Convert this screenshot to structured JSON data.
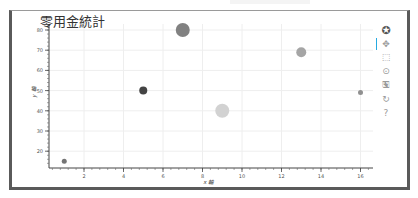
{
  "chart_data": {
    "type": "scatter",
    "title": "零用金統計",
    "xlabel": "x 軸",
    "ylabel": "y 軸",
    "xlim": [
      0.2,
      16.7
    ],
    "ylim": [
      12,
      83
    ],
    "x_ticks": [
      2,
      4,
      6,
      8,
      10,
      12,
      14,
      16
    ],
    "y_ticks": [
      20,
      30,
      40,
      50,
      60,
      70,
      80
    ],
    "grid": true,
    "legend": null,
    "points": [
      {
        "x": 1,
        "y": 15,
        "size": 5,
        "color": "#6e6e6e"
      },
      {
        "x": 5,
        "y": 50,
        "size": 8,
        "color": "#3a3a3a"
      },
      {
        "x": 7,
        "y": 80,
        "size": 14,
        "color": "#7a7a7a"
      },
      {
        "x": 9,
        "y": 40,
        "size": 14,
        "color": "#d0d0d0"
      },
      {
        "x": 13,
        "y": 69,
        "size": 10,
        "color": "#a0a0a0"
      },
      {
        "x": 16,
        "y": 49,
        "size": 5,
        "color": "#8a8a8a"
      }
    ]
  },
  "toolbar": {
    "tools": [
      {
        "name": "bokeh-logo",
        "glyph": "✪",
        "active": false
      },
      {
        "name": "pan-tool",
        "glyph": "✥",
        "active": true
      },
      {
        "name": "box-zoom-tool",
        "glyph": "⬚",
        "active": false
      },
      {
        "name": "wheel-zoom-tool",
        "glyph": "⊙",
        "active": false
      },
      {
        "name": "save-tool",
        "glyph": "🖫",
        "active": false
      },
      {
        "name": "reset-tool",
        "glyph": "↻",
        "active": false
      },
      {
        "name": "help-tool",
        "glyph": "?",
        "active": false
      }
    ]
  }
}
